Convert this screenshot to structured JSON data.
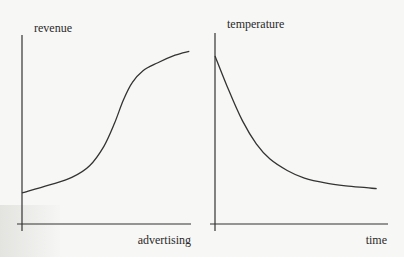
{
  "chart_data": [
    {
      "type": "line",
      "title": "",
      "ylabel": "revenue",
      "xlabel": "advertising",
      "description": "S-shaped (sigmoid) curve: revenue rises slowly at low advertising, steeply in the middle, then levels off",
      "grid": false,
      "xlim": [
        0,
        10
      ],
      "ylim": [
        0,
        10
      ],
      "x": [
        0.0,
        1.5,
        2.8,
        3.8,
        4.6,
        5.2,
        5.7,
        6.2,
        6.8,
        7.6,
        8.6,
        9.4
      ],
      "values": [
        1.6,
        2.0,
        2.4,
        3.0,
        4.0,
        5.2,
        6.4,
        7.3,
        7.9,
        8.3,
        8.7,
        8.9
      ],
      "color": "#333333"
    },
    {
      "type": "line",
      "title": "",
      "ylabel": "temperature",
      "xlabel": "time",
      "description": "Decaying curve: temperature drops rapidly at first, then levels off toward a constant",
      "grid": false,
      "xlim": [
        0,
        10
      ],
      "ylim": [
        0,
        10
      ],
      "x": [
        0.0,
        0.8,
        1.6,
        2.4,
        3.2,
        4.2,
        5.2,
        6.4,
        7.6,
        8.8,
        9.4
      ],
      "values": [
        8.8,
        7.0,
        5.4,
        4.2,
        3.4,
        2.8,
        2.4,
        2.15,
        2.0,
        1.9,
        1.85
      ],
      "color": "#333333"
    }
  ]
}
